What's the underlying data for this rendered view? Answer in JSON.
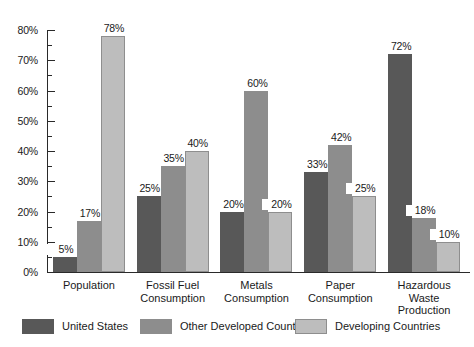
{
  "chart_data": {
    "type": "bar",
    "title": "",
    "xlabel": "",
    "ylabel": "",
    "ylim": [
      0,
      80
    ],
    "grid": false,
    "legend_position": "bottom",
    "categories": [
      "Population",
      "Fossil Fuel\nConsumption",
      "Metals\nConsumption",
      "Paper\nConsumption",
      "Hazardous\nWaste Production"
    ],
    "ytick_labels": [
      "0%",
      "10%",
      "20%",
      "30%",
      "40%",
      "50%",
      "60%",
      "70%",
      "80%"
    ],
    "ytick_values": [
      0,
      10,
      20,
      30,
      40,
      50,
      60,
      70,
      80
    ],
    "series": [
      {
        "name": "United States",
        "color": "#585858",
        "values": [
          5,
          25,
          20,
          33,
          72
        ],
        "labels": [
          "5%",
          "25%",
          "20%",
          "33%",
          "72%"
        ]
      },
      {
        "name": "Other Developed Countries",
        "color": "#8d8d8d",
        "values": [
          17,
          35,
          60,
          42,
          18
        ],
        "labels": [
          "17%",
          "35%",
          "60%",
          "42%",
          "18%"
        ]
      },
      {
        "name": "Developing Countries",
        "color": "#bdbdbd",
        "values": [
          78,
          40,
          20,
          25,
          10
        ],
        "labels": [
          "78%",
          "40%",
          "20%",
          "25%",
          "10%"
        ]
      }
    ]
  }
}
